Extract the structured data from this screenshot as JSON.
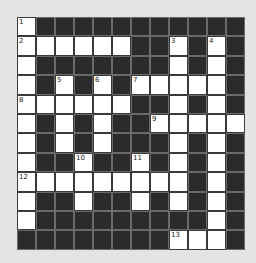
{
  "puzzle": {
    "rows": 12,
    "cols": 12,
    "layout": [
      "W...........",
      "WWWWWW..W.W.",
      "W.......W.W.",
      "W.W.W.WWWWW.",
      "WWWWWW..W.W.",
      "W.W.W..WWWWW",
      "W.W.W...W.W.",
      "W..W..W.W.W.",
      "WWWWWWWWW.W.",
      "W..W..W.W.W.",
      "W.........W.",
      "........WWW."
    ],
    "numbers": [
      {
        "row": 0,
        "col": 0,
        "n": "1"
      },
      {
        "row": 1,
        "col": 0,
        "n": "2"
      },
      {
        "row": 1,
        "col": 8,
        "n": "3"
      },
      {
        "row": 1,
        "col": 10,
        "n": "4"
      },
      {
        "row": 3,
        "col": 2,
        "n": "5"
      },
      {
        "row": 3,
        "col": 4,
        "n": "6"
      },
      {
        "row": 3,
        "col": 6,
        "n": "7"
      },
      {
        "row": 4,
        "col": 0,
        "n": "8"
      },
      {
        "row": 5,
        "col": 7,
        "n": "9"
      },
      {
        "row": 7,
        "col": 3,
        "n": "10"
      },
      {
        "row": 7,
        "col": 6,
        "n": "11"
      },
      {
        "row": 8,
        "col": 0,
        "n": "12"
      },
      {
        "row": 11,
        "col": 8,
        "n": "13"
      }
    ]
  }
}
